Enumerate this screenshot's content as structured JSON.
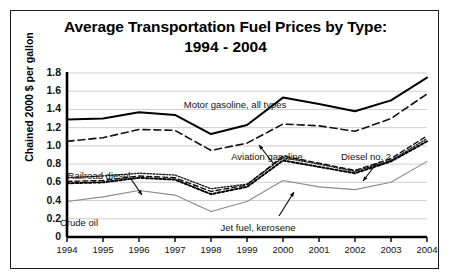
{
  "chart_data": {
    "type": "line",
    "title": "Average Transportation Fuel Prices by Type:",
    "title_line2": "1994 - 2004",
    "xlabel": "",
    "ylabel": "Chained 2000 $ per gallon",
    "xlim": [
      1994,
      2004
    ],
    "ylim": [
      0,
      1.8
    ],
    "grid": true,
    "legend_position": "inline-annotations",
    "categories": [
      1994,
      1995,
      1996,
      1997,
      1998,
      1999,
      2000,
      2001,
      2002,
      2003,
      2004
    ],
    "ytick_labels": [
      "1.8",
      "1.6",
      "1.4",
      "1.2",
      "1.0",
      "0.8",
      "0.6",
      "0.4",
      "0.2",
      "0"
    ],
    "ytick_values": [
      1.8,
      1.6,
      1.4,
      1.2,
      1.0,
      0.8,
      0.6,
      0.4,
      0.2,
      0
    ],
    "xtick_labels": [
      "1994",
      "1995",
      "1996",
      "1997",
      "1998",
      "1999",
      "2000",
      "2001",
      "2002",
      "2003",
      "2004"
    ],
    "series": [
      {
        "name": "Motor gasoline, all types",
        "style": "thick-solid",
        "color": "#000000",
        "values": [
          1.29,
          1.3,
          1.37,
          1.34,
          1.13,
          1.23,
          1.53,
          1.46,
          1.38,
          1.5,
          1.75
        ]
      },
      {
        "name": "Aviation gasoline",
        "style": "dashed",
        "color": "#111111",
        "values": [
          1.05,
          1.09,
          1.18,
          1.17,
          0.95,
          1.03,
          1.24,
          1.22,
          1.16,
          1.3,
          1.57
        ]
      },
      {
        "name": "Railroad diesel",
        "style": "fine-dotted",
        "color": "#222222",
        "values": [
          0.65,
          0.67,
          0.7,
          0.68,
          0.53,
          0.58,
          0.87,
          0.8,
          0.72,
          0.84,
          1.08
        ]
      },
      {
        "name": "Diesel no. 2",
        "style": "dash-dash",
        "color": "#111111",
        "values": [
          0.61,
          0.62,
          0.67,
          0.65,
          0.5,
          0.57,
          0.89,
          0.81,
          0.73,
          0.86,
          1.11
        ]
      },
      {
        "name": "Jet fuel, kerosene",
        "style": "thick-dotted",
        "color": "#000000",
        "values": [
          0.59,
          0.6,
          0.65,
          0.63,
          0.47,
          0.55,
          0.84,
          0.77,
          0.7,
          0.83,
          1.05
        ]
      },
      {
        "name": "Crude oil",
        "style": "thin-gray",
        "color": "#8a8a8a",
        "values": [
          0.39,
          0.44,
          0.51,
          0.46,
          0.28,
          0.39,
          0.62,
          0.55,
          0.52,
          0.6,
          0.83
        ]
      }
    ],
    "annotations": [
      {
        "text": "Motor gasoline, all types",
        "x": 224,
        "y": 88
      },
      {
        "text": "Aviation gasoline",
        "x": 256,
        "y": 140
      },
      {
        "text": "Diesel no. 2",
        "x": 355,
        "y": 140
      },
      {
        "text": "Railroad diesel",
        "x": 88,
        "y": 159
      },
      {
        "text": "Crude oil",
        "x": 68,
        "y": 206
      },
      {
        "text": "Jet fuel, kerosene",
        "x": 247,
        "y": 211
      }
    ]
  }
}
